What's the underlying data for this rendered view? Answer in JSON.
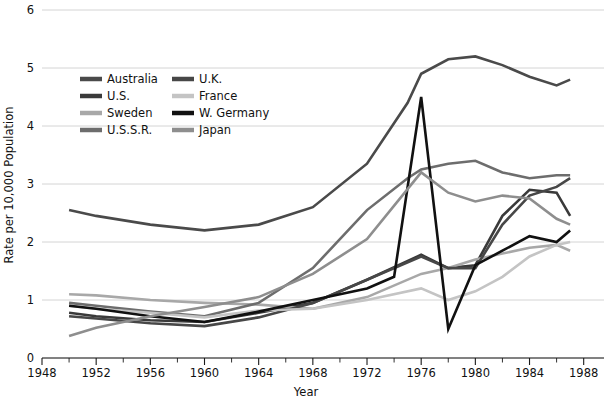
{
  "chart_data": {
    "type": "line",
    "title": "",
    "xlabel": "Year",
    "ylabel": "Rate per 10,000 Population",
    "xlim": [
      1948,
      1989.5
    ],
    "ylim": [
      0,
      6
    ],
    "xticks": [
      1948,
      1952,
      1956,
      1960,
      1964,
      1968,
      1972,
      1976,
      1980,
      1984,
      1988
    ],
    "xticks_minor": [
      1950,
      1954,
      1958,
      1962,
      1966,
      1970,
      1974,
      1978,
      1982,
      1986
    ],
    "yticks": [
      0,
      1,
      2,
      3,
      4,
      5,
      6
    ],
    "grid": "horizontal",
    "legend_position": "upper-left-inside",
    "series": [
      {
        "name": "Australia",
        "color": "#4a4a4a",
        "width": 2.6,
        "x": [
          1950,
          1952,
          1956,
          1960,
          1964,
          1968,
          1972,
          1975,
          1976,
          1978,
          1980,
          1982,
          1984,
          1986,
          1987
        ],
        "y": [
          2.55,
          2.45,
          2.3,
          2.2,
          2.3,
          2.6,
          3.35,
          4.4,
          4.9,
          5.15,
          5.2,
          5.05,
          4.85,
          4.7,
          4.8
        ]
      },
      {
        "name": "U.S.",
        "color": "#3a3a3a",
        "width": 2.6,
        "x": [
          1950,
          1952,
          1956,
          1960,
          1964,
          1968,
          1972,
          1976,
          1978,
          1980,
          1982,
          1984,
          1986,
          1987
        ],
        "y": [
          0.78,
          0.72,
          0.65,
          0.62,
          0.78,
          0.95,
          1.35,
          1.78,
          1.55,
          1.6,
          2.45,
          2.9,
          2.85,
          2.45
        ]
      },
      {
        "name": "Sweden",
        "color": "#a8a8a8",
        "width": 2.6,
        "x": [
          1950,
          1952,
          1956,
          1960,
          1964,
          1968,
          1972,
          1976,
          1978,
          1980,
          1982,
          1984,
          1986,
          1987
        ],
        "y": [
          1.1,
          1.08,
          1.0,
          0.95,
          0.92,
          0.85,
          1.05,
          1.45,
          1.55,
          1.7,
          1.8,
          1.9,
          1.95,
          1.85
        ]
      },
      {
        "name": "U.S.S.R.",
        "color": "#6d6d6d",
        "width": 2.6,
        "x": [
          1950,
          1952,
          1956,
          1960,
          1964,
          1968,
          1972,
          1975,
          1976,
          1978,
          1980,
          1982,
          1984,
          1986,
          1987
        ],
        "y": [
          0.95,
          0.9,
          0.8,
          0.72,
          0.95,
          1.55,
          2.55,
          3.1,
          3.25,
          3.35,
          3.4,
          3.2,
          3.1,
          3.15,
          3.15
        ]
      },
      {
        "name": "U.K.",
        "color": "#474747",
        "width": 2.6,
        "x": [
          1950,
          1952,
          1956,
          1960,
          1964,
          1968,
          1972,
          1976,
          1978,
          1980,
          1982,
          1984,
          1986,
          1987
        ],
        "y": [
          0.72,
          0.68,
          0.6,
          0.55,
          0.7,
          0.95,
          1.35,
          1.75,
          1.55,
          1.55,
          2.3,
          2.8,
          2.95,
          3.1
        ]
      },
      {
        "name": "France",
        "color": "#c4c4c4",
        "width": 2.6,
        "x": [
          1950,
          1952,
          1956,
          1960,
          1964,
          1968,
          1972,
          1976,
          1978,
          1980,
          1982,
          1984,
          1986,
          1987
        ],
        "y": [
          0.9,
          0.85,
          0.78,
          0.7,
          0.82,
          0.85,
          1.0,
          1.2,
          1.0,
          1.15,
          1.4,
          1.75,
          1.95,
          2.0
        ]
      },
      {
        "name": "W. Germany",
        "color": "#111111",
        "width": 2.6,
        "x": [
          1950,
          1952,
          1956,
          1960,
          1964,
          1968,
          1972,
          1974,
          1976,
          1978,
          1980,
          1982,
          1984,
          1986,
          1987
        ],
        "y": [
          0.9,
          0.85,
          0.72,
          0.62,
          0.8,
          1.0,
          1.2,
          1.4,
          4.5,
          0.5,
          1.6,
          1.85,
          2.1,
          2.0,
          2.2
        ]
      },
      {
        "name": "Japan",
        "color": "#8e8e8e",
        "width": 2.6,
        "x": [
          1950,
          1952,
          1956,
          1960,
          1964,
          1968,
          1972,
          1976,
          1978,
          1980,
          1982,
          1984,
          1986,
          1987
        ],
        "y": [
          0.38,
          0.52,
          0.72,
          0.88,
          1.05,
          1.45,
          2.05,
          3.2,
          2.85,
          2.7,
          2.8,
          2.75,
          2.4,
          2.3
        ]
      }
    ],
    "legend": [
      {
        "label": "Australia",
        "color": "#4a4a4a",
        "column": 0,
        "row": 0
      },
      {
        "label": "U.S.",
        "color": "#3a3a3a",
        "column": 0,
        "row": 1
      },
      {
        "label": "Sweden",
        "color": "#a8a8a8",
        "column": 0,
        "row": 2
      },
      {
        "label": "U.S.S.R.",
        "color": "#6d6d6d",
        "column": 0,
        "row": 3
      },
      {
        "label": "U.K.",
        "color": "#474747",
        "column": 1,
        "row": 0
      },
      {
        "label": "France",
        "color": "#c4c4c4",
        "column": 1,
        "row": 1
      },
      {
        "label": "W. Germany",
        "color": "#111111",
        "column": 1,
        "row": 2
      },
      {
        "label": "Japan",
        "color": "#8e8e8e",
        "column": 1,
        "row": 3
      }
    ]
  },
  "colors": {
    "background": "#ffffff",
    "grid": "#c9c9c9",
    "axis": "#1a1a1a",
    "text": "#111111"
  }
}
